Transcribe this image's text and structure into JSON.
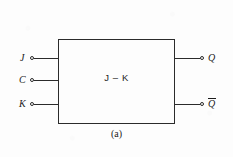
{
  "figure": {
    "caption": "(a)",
    "caption_prefix": "(",
    "caption_letter": "a",
    "caption_suffix": ")",
    "block_label": "J – K",
    "ink_color": "#2b2b2b",
    "background_color": "#fdfdfd"
  },
  "inputs": [
    {
      "label": "J",
      "terminal": "open-circle"
    },
    {
      "label": "C",
      "terminal": "open-circle"
    },
    {
      "label": "K",
      "terminal": "open-circle"
    }
  ],
  "outputs": [
    {
      "label": "Q",
      "overbar": false,
      "terminal": "open-circle"
    },
    {
      "label": "Q",
      "overbar": true,
      "terminal": "open-circle"
    }
  ]
}
